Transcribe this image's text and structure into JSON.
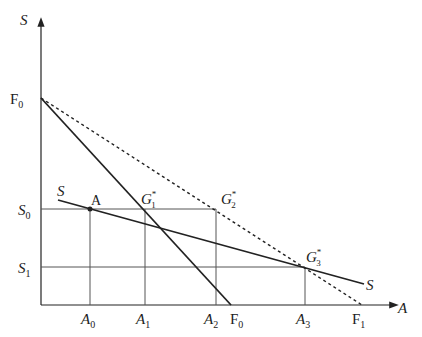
{
  "diagram": {
    "axes": {
      "y_label": "S",
      "x_label": "A"
    },
    "y_ticks": {
      "F0": "F",
      "F0_sub": "0",
      "S0": "S",
      "S0_sub": "0",
      "S1": "S",
      "S1_sub": "1"
    },
    "x_ticks": {
      "A0": "A",
      "A0_sub": "0",
      "A1": "A",
      "A1_sub": "1",
      "A2": "A",
      "A2_sub": "2",
      "F0": "F",
      "F0_sub": "0",
      "A3": "A",
      "A3_sub": "3",
      "F1": "F",
      "F1_sub": "1"
    },
    "points": {
      "A": "A",
      "G1": "G",
      "G1_sub": "1",
      "G1_sup": "*",
      "G2": "G",
      "G2_sub": "2",
      "G2_sup": "*",
      "G3": "G",
      "G3_sub": "3",
      "G3_sup": "*"
    },
    "curves": {
      "S_left": "S",
      "S_right": "S"
    },
    "colors": {
      "line": "#222222",
      "grid": "#555555"
    }
  }
}
